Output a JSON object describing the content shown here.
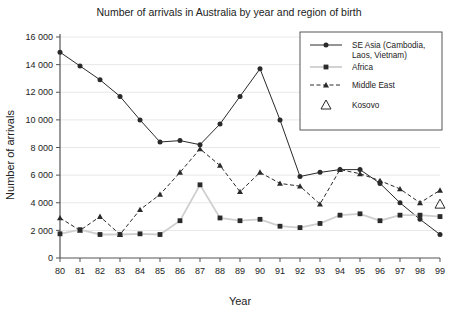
{
  "chart_data": {
    "type": "line",
    "title": "Number of arrivals in Australia by year and region of birth",
    "xlabel": "Year",
    "ylabel": "Number of arrivals",
    "categories": [
      "80",
      "81",
      "82",
      "83",
      "84",
      "85",
      "86",
      "87",
      "88",
      "89",
      "90",
      "91",
      "92",
      "93",
      "94",
      "95",
      "96",
      "97",
      "98",
      "99"
    ],
    "xlim": [
      0,
      19
    ],
    "ylim": [
      0,
      16000
    ],
    "yticks": [
      0,
      2000,
      4000,
      6000,
      8000,
      10000,
      12000,
      14000,
      16000
    ],
    "ytick_labels": [
      "0",
      "2 000",
      "4 000",
      "6 000",
      "8 000",
      "10 000",
      "12 000",
      "14 000",
      "16 000"
    ],
    "grid": "horizontal",
    "legend_position": "top-right",
    "series": [
      {
        "name": "SE Asia (Cambodia, Laos, Vietnam)",
        "marker": "circle",
        "line_style": "solid",
        "color": "#2a2a2a",
        "values": [
          14900,
          13900,
          12900,
          11700,
          10000,
          8400,
          8500,
          8200,
          9700,
          11700,
          13700,
          10000,
          5900,
          6200,
          6400,
          6400,
          5400,
          4000,
          2800,
          1700
        ]
      },
      {
        "name": "Africa",
        "marker": "square",
        "line_style": "solid",
        "color": "#cfcfcf",
        "values": [
          1750,
          2050,
          1700,
          1700,
          1750,
          1700,
          2700,
          5300,
          2900,
          2700,
          2800,
          2300,
          2200,
          2500,
          3100,
          3200,
          2700,
          3100,
          3100,
          3000
        ]
      },
      {
        "name": "Middle East",
        "marker": "triangle",
        "line_style": "dashed",
        "color": "#2a2a2a",
        "values": [
          2900,
          2000,
          3000,
          1700,
          3500,
          4600,
          6200,
          7900,
          6700,
          4800,
          6200,
          5400,
          5200,
          3900,
          6400,
          6100,
          5600,
          5000,
          4000,
          4900
        ]
      },
      {
        "name": "Kosovo",
        "marker": "open-triangle",
        "line_style": "none",
        "color": "#2a2a2a",
        "values": [
          null,
          null,
          null,
          null,
          null,
          null,
          null,
          null,
          null,
          null,
          null,
          null,
          null,
          null,
          null,
          null,
          null,
          null,
          null,
          3900
        ]
      }
    ]
  },
  "legend": {
    "entries": [
      {
        "label_line1": "SE Asia (Cambodia,",
        "label_line2": "Laos, Vietnam)"
      },
      {
        "label_line1": "Africa",
        "label_line2": ""
      },
      {
        "label_line1": "Middle East",
        "label_line2": ""
      },
      {
        "label_line1": "Kosovo",
        "label_line2": ""
      }
    ]
  }
}
